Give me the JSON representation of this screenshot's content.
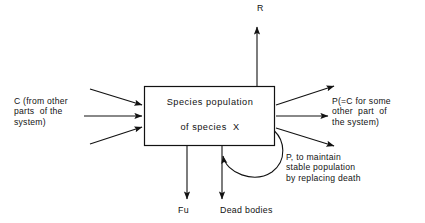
{
  "diagram": {
    "stroke_color": "#121212",
    "text_color": "#121212",
    "background_color": "#ffffff",
    "box": {
      "name": "species-population-box",
      "line1": "Species population",
      "line2": "of species  X"
    },
    "labels": {
      "input_c": "C (from other\nparts  of the\nsystem)",
      "output_p": "P(=C for some\nother  part  of\nthe system)",
      "feedback": "P, to maintain\nstable population\nby replacing death",
      "respiration": "R",
      "fu": "Fu",
      "dead_bodies": "Dead bodies"
    },
    "flows": [
      {
        "id": "input-upper",
        "label": "C (from other parts of the system)",
        "direction": "in",
        "side": "left"
      },
      {
        "id": "input-middle",
        "label": "C (from other parts of the system)",
        "direction": "in",
        "side": "left"
      },
      {
        "id": "input-lower",
        "label": "C (from other parts of the system)",
        "direction": "in",
        "side": "left"
      },
      {
        "id": "output-upper",
        "label": "P(=C for some other part of the system)",
        "direction": "out",
        "side": "right"
      },
      {
        "id": "output-middle",
        "label": "P(=C for some other part of the system)",
        "direction": "out",
        "side": "right"
      },
      {
        "id": "output-lower",
        "label": "P(=C for some other part of the system)",
        "direction": "out",
        "side": "right"
      },
      {
        "id": "output-respiration",
        "label": "R",
        "direction": "out",
        "side": "top"
      },
      {
        "id": "output-fu",
        "label": "Fu",
        "direction": "out",
        "side": "bottom"
      },
      {
        "id": "output-dead-bodies",
        "label": "Dead bodies",
        "direction": "out",
        "side": "bottom"
      },
      {
        "id": "feedback-loop",
        "label": "P, to maintain stable population by replacing death",
        "direction": "loop",
        "side": "bottom-right"
      }
    ]
  }
}
